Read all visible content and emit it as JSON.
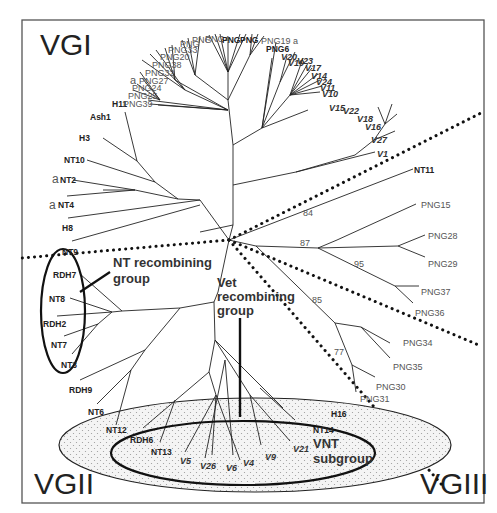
{
  "figure": {
    "type": "unrooted phylogenetic tree",
    "groups": [
      "VGI",
      "VGII",
      "VGIII"
    ],
    "annotations": {
      "nt_recombining": "NT recombining group",
      "nt_recombining_line1": "NT recombining",
      "nt_recombining_line2": "group",
      "vet_recombining_line1": "Vet",
      "vet_recombining_line2": "recombining",
      "vet_recombining_line3": "group",
      "vnt_line1": "VNT",
      "vnt_line2": "subgroup"
    },
    "vgi_labels": {
      "ash1": "Ash1",
      "h11": "H11",
      "h3": "H3",
      "nt10": "NT10",
      "nt2": "NT2",
      "nt4": "NT4",
      "a1": "a",
      "a2": "a",
      "a3": "a",
      "h8": "H8",
      "nt9": "NT9",
      "png39": "PNG39",
      "png25": "PNG25",
      "png24": "PNG24",
      "png27": "PNG27",
      "png32": "PNG32",
      "png38": "PNG38",
      "png20": "PNG20",
      "png33": "PNG33",
      "png19a": "PNG19 a",
      "png6": "PNG6",
      "v20": "V20",
      "v19": "V19",
      "v23": "V23",
      "v17": "V17",
      "v14": "V14",
      "v24": "V24",
      "v11": "V11",
      "v10": "V10",
      "v15": "V15",
      "v22": "V22",
      "v18": "V18",
      "v16": "V16",
      "v27": "V27",
      "v1": "V1"
    },
    "vgii_labels": {
      "rdh7": "RDH7",
      "nt8": "NT8",
      "rdh2": "RDH2",
      "nt7": "NT7",
      "nt3": "NT3",
      "rdh9": "RDH9",
      "nt6": "NT6",
      "nt12": "NT12",
      "rdh6": "RDH6",
      "nt13": "NT13",
      "v5": "V5",
      "v26": "V26",
      "v6": "V6",
      "v4": "V4",
      "v9": "V9",
      "v21": "V21",
      "nt14": "NT14",
      "h16": "H16"
    },
    "vgiii_labels": {
      "nt11": "NT11",
      "png15": "PNG15",
      "png28": "PNG28",
      "png29": "PNG29",
      "png37": "PNG37",
      "png36": "PNG36",
      "png34": "PNG34",
      "png35": "PNG35",
      "png30": "PNG30",
      "png31": "PNG31"
    },
    "bootstrap": {
      "b84": "84",
      "b87": "87",
      "b95": "95",
      "b85": "85",
      "b77": "77"
    }
  }
}
